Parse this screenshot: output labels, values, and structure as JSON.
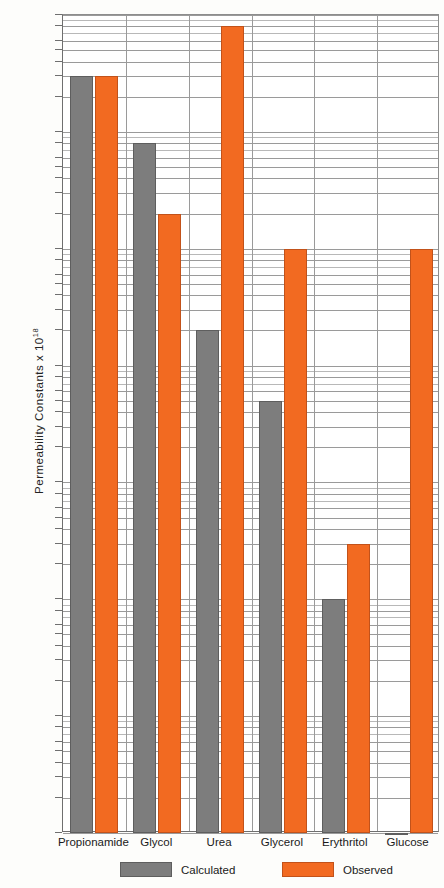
{
  "chart_data": {
    "type": "bar",
    "title": "",
    "xlabel": "",
    "ylabel": "Permeability Constants x 10",
    "ylabel_exponent": "18",
    "yscale": "log",
    "ylim": [
      1e-06,
      10
    ],
    "grid": true,
    "legend_position": "bottom",
    "categories": [
      "Propionamide",
      "Glycol",
      "Urea",
      "Glycerol",
      "Erythritol",
      "Glucose"
    ],
    "series": [
      {
        "name": "Calculated",
        "color": "#7d7d7d",
        "values": [
          3,
          0.8,
          0.02,
          0.005,
          0.0001,
          1e-06
        ]
      },
      {
        "name": "Observed",
        "color": "#f26a21",
        "values": [
          3,
          0.2,
          8,
          0.1,
          0.0003,
          0.1
        ]
      }
    ],
    "ytick_labels": [
      "10",
      "8",
      "6",
      "5",
      "4",
      "3",
      "2",
      "1",
      ".8",
      ".6",
      ".5",
      ".4",
      ".3",
      ".2",
      ".1",
      ".08",
      ".06",
      ".05",
      ".04",
      ".03",
      ".02",
      ".01",
      ".008",
      ".006",
      ".005",
      ".004",
      ".003",
      ".002",
      ".001",
      ".0008",
      ".0006",
      ".0005",
      ".0004",
      ".0003",
      ".0002",
      ".0001",
      ".00008",
      ".00006",
      ".00005",
      ".00004",
      ".00003",
      ".00002",
      ".00001",
      ".000008",
      ".000006",
      ".000005",
      ".000004",
      ".000003",
      ".000002",
      ".000001"
    ],
    "ytick_values": [
      10,
      8,
      6,
      5,
      4,
      3,
      2,
      1,
      0.8,
      0.6,
      0.5,
      0.4,
      0.3,
      0.2,
      0.1,
      0.08,
      0.06,
      0.05,
      0.04,
      0.03,
      0.02,
      0.01,
      0.008,
      0.006,
      0.005,
      0.004,
      0.003,
      0.002,
      0.001,
      0.0008,
      0.0006,
      0.0005,
      0.0004,
      0.0003,
      0.0002,
      0.0001,
      8e-05,
      6e-05,
      5e-05,
      4e-05,
      3e-05,
      2e-05,
      1e-05,
      8e-06,
      6e-06,
      5e-06,
      4e-06,
      3e-06,
      2e-06,
      1e-06
    ],
    "yminor_values": [
      9,
      7,
      0.9,
      0.7,
      0.09,
      0.07,
      0.009,
      0.007,
      0.0009,
      0.0007,
      9e-05,
      7e-05,
      9e-06,
      7e-06
    ]
  },
  "legend": {
    "items": [
      {
        "label": "Calculated"
      },
      {
        "label": "Observed"
      }
    ]
  }
}
